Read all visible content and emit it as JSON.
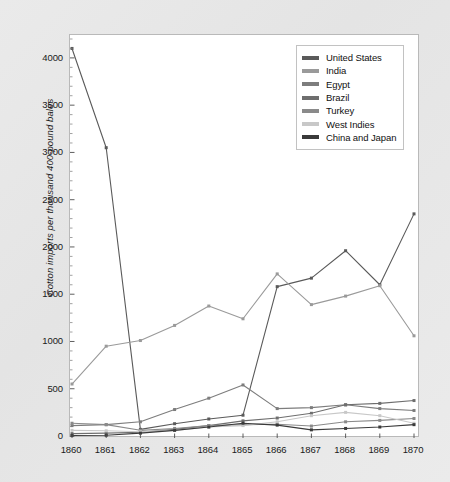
{
  "chart_data": {
    "type": "line",
    "title": "",
    "xlabel": "",
    "ylabel": "Cotton imports per thousand 400-pound bales",
    "x": [
      1860,
      1861,
      1862,
      1863,
      1864,
      1865,
      1866,
      1867,
      1868,
      1869,
      1870
    ],
    "categories": [
      "1860",
      "1861",
      "1862",
      "1863",
      "1864",
      "1865",
      "1866",
      "1867",
      "1868",
      "1869",
      "1870"
    ],
    "xlim": [
      1860,
      1870
    ],
    "ylim": [
      0,
      4200
    ],
    "y_ticks": [
      0,
      500,
      1000,
      1500,
      2000,
      2500,
      3000,
      3500,
      4000
    ],
    "y_tick_labels": [
      "0",
      "500",
      "1000",
      "1500",
      "2000",
      "2500",
      "3000",
      "3500",
      "4000"
    ],
    "x_ticks": [
      1860,
      1861,
      1862,
      1863,
      1864,
      1865,
      1866,
      1867,
      1868,
      1869,
      1870
    ],
    "x_tick_labels": [
      "1860",
      "1861",
      "1862",
      "1863",
      "1864",
      "1865",
      "1866",
      "1867",
      "1868",
      "1869",
      "1870"
    ],
    "grid": false,
    "minor_ticks": true,
    "markers": true,
    "legend_position": "top-right",
    "series": [
      {
        "name": "United States",
        "color": "#5a5a5a",
        "values": [
          4100,
          3050,
          70,
          130,
          180,
          220,
          1580,
          1670,
          1960,
          1600,
          2350
        ]
      },
      {
        "name": "India",
        "color": "#9a9a9a",
        "values": [
          550,
          950,
          1010,
          1170,
          1375,
          1240,
          1715,
          1390,
          1480,
          1590,
          1060
        ]
      },
      {
        "name": "Egypt",
        "color": "#7d7d7d",
        "values": [
          110,
          120,
          150,
          280,
          400,
          540,
          290,
          300,
          330,
          290,
          270
        ]
      },
      {
        "name": "Brazil",
        "color": "#6e6e6e",
        "values": [
          25,
          30,
          40,
          70,
          110,
          160,
          190,
          240,
          330,
          345,
          375
        ]
      },
      {
        "name": "Turkey",
        "color": "#8a8a8a",
        "values": [
          135,
          120,
          60,
          80,
          110,
          120,
          125,
          105,
          150,
          165,
          185
        ]
      },
      {
        "name": "West Indies",
        "color": "#c8c8c8",
        "values": [
          60,
          55,
          45,
          60,
          95,
          110,
          150,
          215,
          250,
          215,
          135
        ]
      },
      {
        "name": "China and Japan",
        "color": "#3a3a3a",
        "values": [
          5,
          8,
          30,
          60,
          95,
          135,
          115,
          65,
          80,
          95,
          120
        ]
      }
    ]
  },
  "legend": {
    "entries": [
      {
        "label": "United States"
      },
      {
        "label": "India"
      },
      {
        "label": "Egypt"
      },
      {
        "label": "Brazil"
      },
      {
        "label": "Turkey"
      },
      {
        "label": "West Indies"
      },
      {
        "label": "China and Japan"
      }
    ]
  }
}
